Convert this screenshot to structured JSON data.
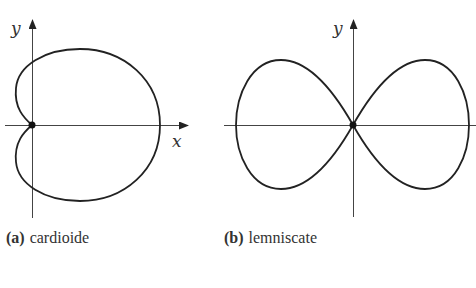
{
  "figure": {
    "panels": [
      {
        "id": "a",
        "tag": "(a)",
        "caption": "cardioide",
        "curve": "cardioid",
        "axes": {
          "x_label": "x",
          "y_label": "y"
        },
        "origin_marked": true
      },
      {
        "id": "b",
        "tag": "(b)",
        "caption": "lemniscate",
        "curve": "lemniscate",
        "axes": {
          "x_label": "",
          "y_label": "y"
        },
        "origin_marked": true
      }
    ],
    "colors": {
      "curve": "#222222",
      "axis": "#444444",
      "background": "#ffffff"
    }
  }
}
